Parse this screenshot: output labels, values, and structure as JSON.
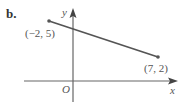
{
  "problem": {
    "part_label": "b."
  },
  "axes": {
    "x_label": "x",
    "y_label": "y",
    "origin_label": "O"
  },
  "segment": {
    "start": {
      "x": -2,
      "y": 5,
      "label": "(−2, 5)"
    },
    "end": {
      "x": 7,
      "y": 2,
      "label": "(7, 2)"
    },
    "color": "#555555"
  },
  "colors": {
    "axis": "#666666",
    "text": "#555555",
    "background": "#ffffff"
  }
}
